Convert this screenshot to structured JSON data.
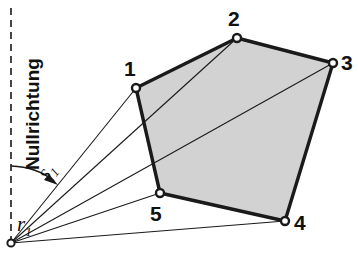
{
  "figure": {
    "type": "technical-geometry-diagram",
    "language": "de",
    "canvas": {
      "width": 358,
      "height": 255
    },
    "background_color": "#ffffff",
    "line_color": "#1a1a1a",
    "polygon_fill_color": "#d2d2d2",
    "labels": {
      "reference_direction": "Nullrichtung",
      "distance_symbol": "s",
      "distance_subscript": "1",
      "angle_symbol": "r",
      "angle_subscript": "1"
    },
    "origin": {
      "name": "station-point",
      "x": 11,
      "y": 243
    },
    "reference_axis": {
      "name": "zero-direction-line",
      "style": "dashed",
      "x": 11,
      "y_top": 8,
      "y_bottom": 243
    },
    "vertices": [
      {
        "id": "1",
        "label": "1",
        "x": 136,
        "y": 88,
        "label_x": 124,
        "label_y": 58
      },
      {
        "id": "2",
        "label": "2",
        "x": 237,
        "y": 38,
        "label_x": 228,
        "label_y": 8
      },
      {
        "id": "3",
        "label": "3",
        "x": 333,
        "y": 63,
        "label_x": 341,
        "label_y": 52
      },
      {
        "id": "4",
        "label": "4",
        "x": 285,
        "y": 221,
        "label_x": 294,
        "label_y": 212
      },
      {
        "id": "5",
        "label": "5",
        "x": 160,
        "y": 193,
        "label_x": 150,
        "label_y": 203
      }
    ],
    "rays": [
      {
        "name": "ray-to-vertex-1",
        "to": "1"
      },
      {
        "name": "ray-to-vertex-2",
        "to": "2"
      },
      {
        "name": "ray-to-vertex-5",
        "to": "5"
      },
      {
        "name": "ray-to-vertex-4",
        "to": "4"
      },
      {
        "name": "ray-to-vertex-3",
        "to": "3"
      }
    ],
    "angle_arc": {
      "name": "angle-arc-r1",
      "from_x": 11,
      "from_y": 166,
      "to_x": 57,
      "to_y": 183,
      "has_arrowhead": true
    },
    "label_positions": {
      "nullrichtung_x": 44,
      "nullrichtung_y": 148,
      "s1_x": 54,
      "s1_y": 158,
      "r1_x": 17,
      "r1_y": 212
    }
  }
}
